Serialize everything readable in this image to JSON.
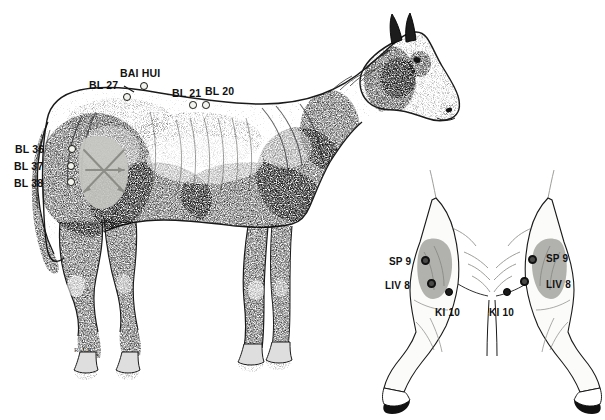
{
  "figure": {
    "view_main": "lateral (side) view of horse",
    "view_inset": "caudal (rear) view of hind limbs",
    "background_color": "#ffffff",
    "ink_color": "#1a1a1a",
    "shade_color": "#c6c6c1",
    "signature": "R.J.R"
  },
  "main_labels": [
    {
      "id": "bai-hui",
      "text": "BAI HUI"
    },
    {
      "id": "bl-27",
      "text": "BL 27"
    },
    {
      "id": "bl-21",
      "text": "BL 21"
    },
    {
      "id": "bl-20",
      "text": "BL 20"
    },
    {
      "id": "bl-36",
      "text": "BL 36"
    },
    {
      "id": "bl-37",
      "text": "BL 37"
    },
    {
      "id": "bl-38",
      "text": "BL 38"
    }
  ],
  "inset_labels": [
    {
      "id": "sp-9-left",
      "text": "SP 9"
    },
    {
      "id": "liv-8-left",
      "text": "LIV 8"
    },
    {
      "id": "ki-10-left",
      "text": "KI 10"
    },
    {
      "id": "sp-9-right",
      "text": "SP 9"
    },
    {
      "id": "liv-8-right",
      "text": "LIV 8"
    },
    {
      "id": "ki-10-right",
      "text": "KI 10"
    }
  ]
}
